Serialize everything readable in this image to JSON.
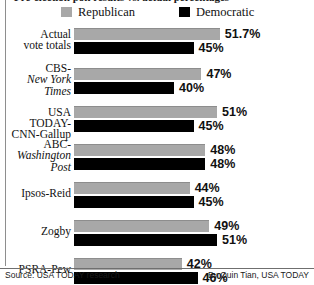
{
  "title_partial": "Pre-election poll results vs. actual percentages",
  "legend": [
    {
      "key": "republican",
      "label": "Republican",
      "color": "#a8a8a8"
    },
    {
      "key": "democratic",
      "label": "Democratic",
      "color": "#000000"
    }
  ],
  "footer": {
    "source": "Source: USA TODAY research",
    "credit": "By Quin Tian, USA TODAY"
  },
  "chart_data": {
    "type": "bar",
    "orientation": "horizontal",
    "title": "Pre-election poll results vs. actual percentages",
    "xlabel": "",
    "ylabel": "",
    "grid": false,
    "legend_position": "top",
    "value_suffix": "%",
    "categories": [
      "Actual vote totals",
      "CBS-New York Times",
      "USA TODAY-CNN-Gallup",
      "ABC-Washington Post",
      "Ipsos-Reid",
      "Zogby",
      "PSRA-Pew"
    ],
    "series": [
      {
        "name": "Republican",
        "color": "#a8a8a8",
        "values": [
          51.7,
          47,
          51,
          48,
          44,
          49,
          42
        ]
      },
      {
        "name": "Democratic",
        "color": "#000000",
        "values": [
          45,
          40,
          45,
          48,
          45,
          51,
          46
        ]
      }
    ],
    "rows": [
      {
        "label_lines": [
          {
            "text": "Actual",
            "italic": false
          },
          {
            "text": "vote totals",
            "italic": false
          }
        ],
        "republican": {
          "value": 51.7,
          "display": "51.7%"
        },
        "democratic": {
          "value": 45,
          "display": "45%"
        }
      },
      {
        "label_lines": [
          {
            "text": "CBS-",
            "italic": false
          },
          {
            "text": "New York",
            "italic": true
          },
          {
            "text": "Times",
            "italic": true
          }
        ],
        "republican": {
          "value": 47,
          "display": "47%"
        },
        "democratic": {
          "value": 40,
          "display": "40%"
        }
      },
      {
        "label_lines": [
          {
            "text": "USA TODAY-",
            "italic": false
          },
          {
            "text": "CNN-Gallup",
            "italic": false
          }
        ],
        "republican": {
          "value": 51,
          "display": "51%"
        },
        "democratic": {
          "value": 45,
          "display": "45%"
        }
      },
      {
        "label_lines": [
          {
            "text": "ABC-",
            "italic": false
          },
          {
            "text": "Washington",
            "italic": true
          },
          {
            "text": "Post",
            "italic": true
          }
        ],
        "republican": {
          "value": 48,
          "display": "48%"
        },
        "democratic": {
          "value": 48,
          "display": "48%"
        }
      },
      {
        "label_lines": [
          {
            "text": "Ipsos-Reid",
            "italic": false
          }
        ],
        "republican": {
          "value": 44,
          "display": "44%"
        },
        "democratic": {
          "value": 45,
          "display": "45%"
        }
      },
      {
        "label_lines": [
          {
            "text": "Zogby",
            "italic": false
          }
        ],
        "republican": {
          "value": 49,
          "display": "49%"
        },
        "democratic": {
          "value": 51,
          "display": "51%"
        }
      },
      {
        "label_lines": [
          {
            "text": "PSRA-Pew",
            "italic": false
          }
        ],
        "republican": {
          "value": 42,
          "display": "42%"
        },
        "democratic": {
          "value": 46,
          "display": "46%"
        }
      }
    ]
  }
}
